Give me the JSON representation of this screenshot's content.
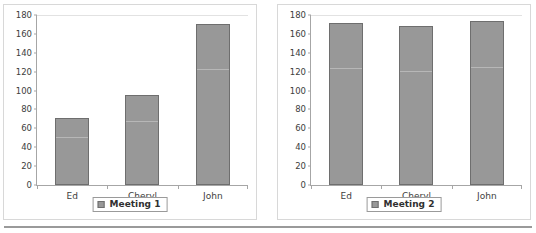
{
  "chart_data": [
    {
      "type": "bar",
      "title": "",
      "xlabel": "",
      "ylabel": "",
      "categories": [
        "Ed",
        "Cheryl",
        "John"
      ],
      "values": [
        71,
        95,
        171
      ],
      "series": [
        {
          "name": "Meeting 1",
          "values": [
            71,
            95,
            171
          ]
        }
      ],
      "ylim": [
        0,
        180
      ],
      "yticks": [
        0,
        20,
        40,
        60,
        80,
        100,
        120,
        140,
        160,
        180
      ],
      "ytick_labels": [
        "0",
        "20",
        "40",
        "60",
        "80",
        "100",
        "120",
        "140",
        "160",
        "180"
      ],
      "grid": false,
      "legend": {
        "position": "bottom",
        "entries": [
          "Meeting 1"
        ]
      },
      "colors": {
        "bar_fill": "#989898",
        "bar_edge": "#6e6e6e",
        "axis": "#a6a6a6"
      }
    },
    {
      "type": "bar",
      "title": "",
      "xlabel": "",
      "ylabel": "",
      "categories": [
        "Ed",
        "Cheryl",
        "John"
      ],
      "values": [
        172,
        168,
        174
      ],
      "series": [
        {
          "name": "Meeting 2",
          "values": [
            172,
            168,
            174
          ]
        }
      ],
      "ylim": [
        0,
        180
      ],
      "yticks": [
        0,
        20,
        40,
        60,
        80,
        100,
        120,
        140,
        160,
        180
      ],
      "ytick_labels": [
        "0",
        "20",
        "40",
        "60",
        "80",
        "100",
        "120",
        "140",
        "160",
        "180"
      ],
      "grid": false,
      "legend": {
        "position": "bottom",
        "entries": [
          "Meeting 2"
        ]
      },
      "colors": {
        "bar_fill": "#989898",
        "bar_edge": "#6e6e6e",
        "axis": "#a6a6a6"
      }
    }
  ]
}
